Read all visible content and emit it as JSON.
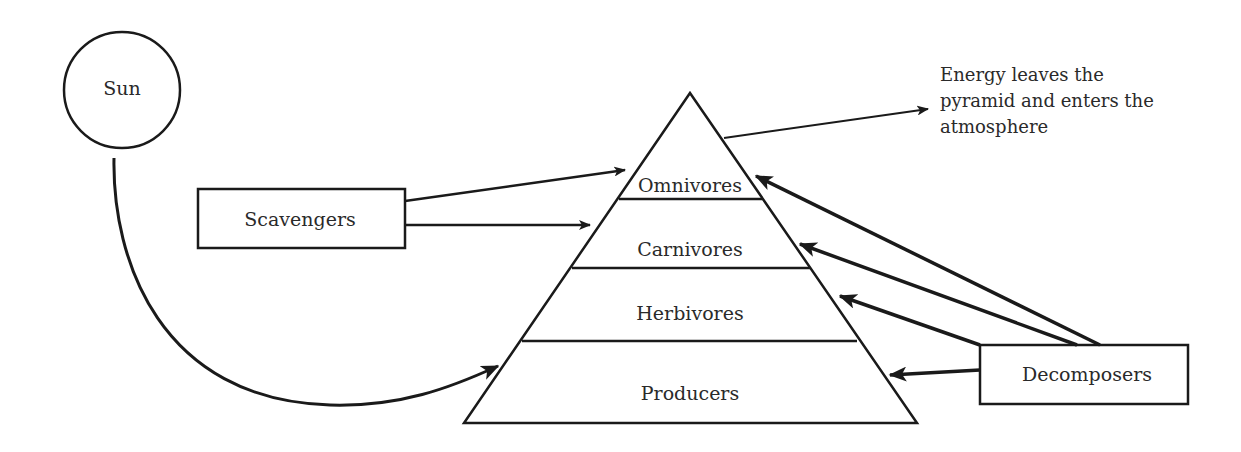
{
  "diagram": {
    "colors": {
      "stroke": "#1a1a1a",
      "text": "#2a2a2a",
      "background": "#ffffff"
    },
    "nodes": {
      "sun": {
        "label": "Sun",
        "shape": "circle"
      },
      "scavengers": {
        "label": "Scavengers",
        "shape": "rectangle"
      },
      "decomposers": {
        "label": "Decomposers",
        "shape": "rectangle"
      }
    },
    "pyramid": {
      "levels": [
        {
          "label": "Omnivores"
        },
        {
          "label": "Carnivores"
        },
        {
          "label": "Herbivores"
        },
        {
          "label": "Producers"
        }
      ]
    },
    "annotation": {
      "lines": [
        "Energy leaves the",
        "pyramid and enters the",
        "atmosphere"
      ]
    },
    "edges": [
      {
        "from": "Sun",
        "to": "Producers",
        "style": "curved-arrow"
      },
      {
        "from": "Scavengers",
        "to": "Omnivores",
        "style": "arrow"
      },
      {
        "from": "Scavengers",
        "to": "Carnivores",
        "style": "arrow"
      },
      {
        "from": "Decomposers",
        "to": "Omnivores",
        "style": "arrow"
      },
      {
        "from": "Decomposers",
        "to": "Carnivores",
        "style": "arrow"
      },
      {
        "from": "Decomposers",
        "to": "Herbivores",
        "style": "arrow"
      },
      {
        "from": "Decomposers",
        "to": "Producers",
        "style": "arrow"
      },
      {
        "from": "Pyramid",
        "to": "Energy leaves the pyramid and enters the atmosphere",
        "style": "arrow"
      }
    ]
  }
}
